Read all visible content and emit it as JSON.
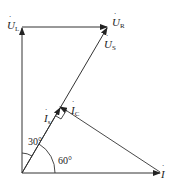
{
  "diagram": {
    "type": "phasor-diagram",
    "labels": {
      "ul": "U",
      "ul_sub": "L",
      "ur": "U",
      "ur_sub": "R",
      "us": "U",
      "us_sub": "S",
      "is": "I",
      "is_sub": "s",
      "ic": "I",
      "ic_sub": "C",
      "i": "I",
      "angle_30": "30°",
      "angle_60": "60°"
    },
    "colors": {
      "line": "#333333",
      "text": "#222222"
    }
  }
}
